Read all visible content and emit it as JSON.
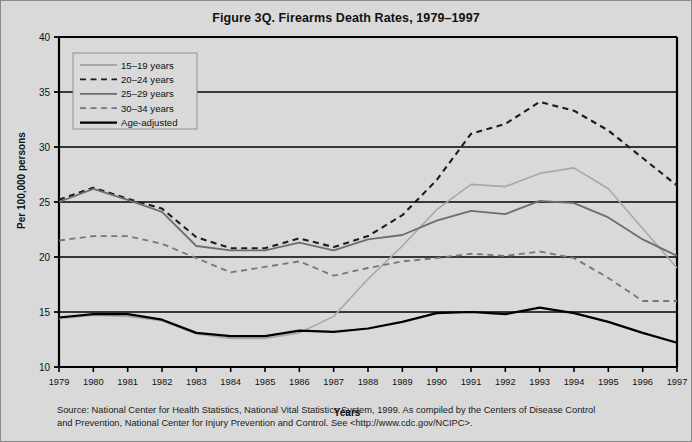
{
  "figure": {
    "title": "Figure 3Q. Firearms Death Rates, 1979–1997",
    "source_line_1": "Source: National Center for Health Statistics,  National Vital Statistics System, 1999.  As compiled by the Centers of Disease Control",
    "source_line_2": "and Prevention,  National Center for Injury Prevention and Control.  See <http://www.cdc.gov/NCIPC>."
  },
  "chart_data": {
    "type": "line",
    "title": "Figure 3Q. Firearms Death Rates, 1979–1997",
    "xlabel": "Years",
    "ylabel": "Per 100,000 persons",
    "x": [
      1979,
      1980,
      1981,
      1982,
      1983,
      1984,
      1985,
      1986,
      1987,
      1988,
      1989,
      1990,
      1991,
      1992,
      1993,
      1994,
      1995,
      1996,
      1997
    ],
    "xticklabels": [
      "1979",
      "1980",
      "1981",
      "1982",
      "1983",
      "1984",
      "1985",
      "1986",
      "1987",
      "1988",
      "1989",
      "1990",
      "1991",
      "1992",
      "1993",
      "1994",
      "1995",
      "1996",
      "1997"
    ],
    "yticks": [
      10,
      15,
      20,
      25,
      30,
      35,
      40
    ],
    "ylim": [
      10,
      40
    ],
    "xlim": [
      1979,
      1997
    ],
    "grid": "horizontal",
    "legend_position": "top-left",
    "series": [
      {
        "name": "15–19 years",
        "style": "solid",
        "color": "#a8a8a8",
        "width": 1.6,
        "values": [
          14.4,
          14.7,
          14.6,
          14.2,
          13.0,
          12.6,
          12.6,
          13.1,
          14.6,
          18.0,
          21.0,
          24.3,
          26.6,
          26.4,
          27.6,
          28.1,
          26.2,
          22.6,
          19.0
        ]
      },
      {
        "name": "20–24 years",
        "style": "dashed",
        "color": "#1c1c1c",
        "width": 2.1,
        "values": [
          25.2,
          26.3,
          25.3,
          24.4,
          21.8,
          20.8,
          20.8,
          21.7,
          20.9,
          21.9,
          23.8,
          27.0,
          31.2,
          32.1,
          34.1,
          33.3,
          31.5,
          29.0,
          26.5
        ]
      },
      {
        "name": "25–29 years",
        "style": "solid",
        "color": "#6e6e6e",
        "width": 1.8,
        "values": [
          25.0,
          26.2,
          25.2,
          24.1,
          21.0,
          20.6,
          20.6,
          21.3,
          20.6,
          21.6,
          22.0,
          23.3,
          24.2,
          23.9,
          25.1,
          24.9,
          23.6,
          21.6,
          20.1
        ]
      },
      {
        "name": "30–34 years",
        "style": "dashed",
        "color": "#777777",
        "width": 1.8,
        "values": [
          21.5,
          21.9,
          21.9,
          21.2,
          19.9,
          18.6,
          19.1,
          19.6,
          18.3,
          19.0,
          19.6,
          19.9,
          20.3,
          20.1,
          20.5,
          19.9,
          18.1,
          16.0,
          16.0
        ]
      },
      {
        "name": "Age-adjusted",
        "style": "solid",
        "color": "#000000",
        "width": 2.2,
        "values": [
          14.5,
          14.8,
          14.8,
          14.3,
          13.1,
          12.8,
          12.8,
          13.3,
          13.2,
          13.5,
          14.1,
          14.9,
          15.0,
          14.8,
          15.4,
          14.9,
          14.1,
          13.1,
          12.2
        ]
      }
    ],
    "legend": [
      {
        "label": "15–19 years",
        "style": "solid",
        "color": "#a8a8a8"
      },
      {
        "label": "20–24 years",
        "style": "dashed",
        "color": "#1c1c1c"
      },
      {
        "label": "25–29 years",
        "style": "solid",
        "color": "#6e6e6e"
      },
      {
        "label": "30–34 years",
        "style": "dashed",
        "color": "#777777"
      },
      {
        "label": "Age-adjusted",
        "style": "solid",
        "color": "#000000"
      }
    ],
    "colors": {
      "background": "#d9d9d9",
      "axis": "#000000",
      "grid": "#000000",
      "text": "#111111"
    }
  }
}
